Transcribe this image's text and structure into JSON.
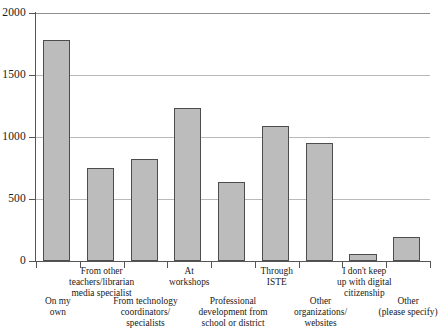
{
  "chart_data": {
    "type": "bar",
    "title": "",
    "subtitle": "",
    "xlabel": "",
    "ylabel": "",
    "ylim": [
      0,
      2000
    ],
    "xlim": [
      0,
      9
    ],
    "grid": true,
    "legend": false,
    "legend_position": "none",
    "bar_color": "#bcbcbc",
    "bar_edge_color": "#4d4d4d",
    "gridline_color": "#b9b9b9",
    "axis_color": "#555555",
    "yticks": [
      0,
      500,
      1000,
      1500,
      2000
    ],
    "ytick_labels": [
      "0",
      "500",
      "1000",
      "1500",
      "2000"
    ],
    "categories": [
      "On my\nown",
      "From other\nteachers/librarian\nmedia specialist",
      "From technology\ncoordinators/\nspecialists",
      "At\nworkshops",
      "Professional\ndevelopment from\nschool or district",
      "Through\nISTE",
      "Other\norganizations/\nwebsites",
      "I don't keep\nup with digital\ncitizenship",
      "Other\n(please specify)"
    ],
    "label_rows": [
      "bottom",
      "top",
      "bottom",
      "top",
      "bottom",
      "top",
      "bottom",
      "top",
      "bottom"
    ],
    "values": [
      1780,
      750,
      820,
      1230,
      640,
      1090,
      950,
      55,
      190
    ]
  }
}
